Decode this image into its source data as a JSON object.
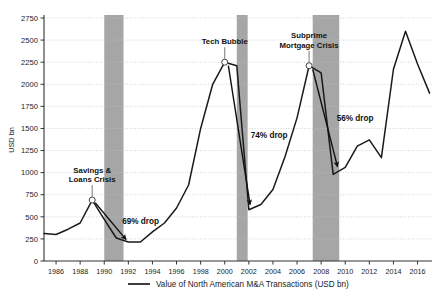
{
  "chart_data": {
    "type": "line",
    "title": "",
    "xlabel": "",
    "ylabel": "USD bn",
    "xlim": [
      1985,
      2017.2
    ],
    "ylim": [
      0,
      2750
    ],
    "grid": true,
    "legend_position": "bottom",
    "series": [
      {
        "name": "Value of North American M&A Transactions (USD bn)",
        "color": "#1a1a1a",
        "x": [
          1985,
          1986,
          1987,
          1988,
          1989,
          1990,
          1991,
          1992,
          1993,
          1994,
          1995,
          1996,
          1997,
          1998,
          1999,
          2000,
          2001,
          2002,
          2003,
          2004,
          2005,
          2006,
          2007,
          2008,
          2009,
          2010,
          2011,
          2012,
          2013,
          2014,
          2015,
          2016,
          2017
        ],
        "values": [
          310,
          300,
          360,
          430,
          690,
          470,
          260,
          215,
          215,
          330,
          430,
          600,
          860,
          1500,
          2000,
          2250,
          2210,
          580,
          640,
          810,
          1180,
          1620,
          2210,
          2130,
          980,
          1060,
          1300,
          1370,
          1170,
          2170,
          2600,
          2230,
          1900
        ]
      }
    ],
    "y_ticks": [
      0,
      250,
      500,
      750,
      1000,
      1250,
      1500,
      1750,
      2000,
      2250,
      2500,
      2750
    ],
    "x_ticks": [
      1986,
      1988,
      1990,
      1992,
      1994,
      1996,
      1998,
      2000,
      2002,
      2004,
      2006,
      2008,
      2010,
      2012,
      2014,
      2016
    ],
    "shaded_bands": [
      {
        "name": "savings-loans-band",
        "x0": 1990.0,
        "x1": 1991.6,
        "color": "#a6a6a6"
      },
      {
        "name": "tech-bubble-band",
        "x0": 2001.0,
        "x1": 2001.9,
        "color": "#a6a6a6"
      },
      {
        "name": "subprime-band",
        "x0": 2007.3,
        "x1": 2009.5,
        "color": "#a6a6a6"
      }
    ],
    "annotations": [
      {
        "name": "savings-loans-crisis",
        "label_line1": "Savings &",
        "label_line2": "Loans Crisis",
        "marker_x": 1989,
        "marker_y": 690,
        "drop_label": "69% drop",
        "arrow_from_x": 1989.25,
        "arrow_from_y": 660,
        "arrow_to_x": 1991.8,
        "arrow_to_y": 245
      },
      {
        "name": "tech-bubble",
        "label_line1": "Tech Bubble",
        "label_line2": "",
        "marker_x": 2000,
        "marker_y": 2250,
        "drop_label": "74% drop",
        "arrow_from_x": 2000.3,
        "arrow_from_y": 2210,
        "arrow_to_x": 2002.1,
        "arrow_to_y": 640
      },
      {
        "name": "subprime-mortgage-crisis",
        "label_line1": "Subprime",
        "label_line2": "Mortgage Crisis",
        "marker_x": 2007,
        "marker_y": 2210,
        "drop_label": "56% drop",
        "arrow_from_x": 2007.3,
        "arrow_from_y": 2170,
        "arrow_to_x": 2009.35,
        "arrow_to_y": 1070
      }
    ],
    "legend": [
      {
        "label": "Value of North American M&A Transactions (USD bn)",
        "color": "#1a1a1a",
        "marker": "line"
      }
    ]
  },
  "axis": {
    "ylabel": "USD bn"
  }
}
